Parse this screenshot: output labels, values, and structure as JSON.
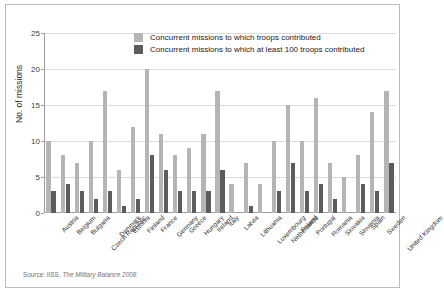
{
  "figure": {
    "background_color": "#ffffff",
    "border_color": "#b9bcc0",
    "source_prefix": "Source: IISS, ",
    "source_title": "The Military Balance",
    "source_year": " 2008."
  },
  "legend": {
    "position": "top-center",
    "items": [
      {
        "label": "Concurrent missions to which troops contributed",
        "color": "#b3b5b7",
        "swatch_name": "legend-swatch-light"
      },
      {
        "label": "Concurrent missions to which at least 100 troops contributed",
        "color": "#5a5c5e",
        "swatch_name": "legend-swatch-dark"
      }
    ]
  },
  "chart_data": {
    "type": "bar",
    "title": "",
    "xlabel": "",
    "ylabel": "No. of missions",
    "ylim": [
      0,
      25
    ],
    "yticks": [
      0,
      5,
      10,
      15,
      20,
      25
    ],
    "grid": true,
    "legend_position": "top-center",
    "categories": [
      "Austria",
      "Belgium",
      "Bulgaria",
      "Czech Republic",
      "Denmark",
      "Estonia",
      "Finland",
      "France",
      "Germany",
      "Greece",
      "Hungary",
      "Ireland",
      "Italy",
      "Latvia",
      "Lithuania",
      "Luxembourg",
      "Netherlands",
      "Poland",
      "Portugal",
      "Romania",
      "Slovakia",
      "Slovenia",
      "Spain",
      "Sweden",
      "United Kingdom"
    ],
    "series": [
      {
        "name": "Concurrent missions to which troops contributed",
        "color": "#b3b5b7",
        "values": [
          10,
          8,
          7,
          10,
          17,
          6,
          12,
          20,
          11,
          8,
          9,
          11,
          17,
          4,
          7,
          4,
          10,
          15,
          10,
          16,
          7,
          5,
          8,
          14,
          17
        ]
      },
      {
        "name": "Concurrent missions to which at least 100 troops contributed",
        "color": "#5a5c5e",
        "values": [
          3,
          4,
          3,
          2,
          3,
          1,
          2,
          8,
          6,
          3,
          3,
          3,
          6,
          0,
          1,
          0,
          3,
          7,
          3,
          4,
          2,
          0,
          4,
          3,
          7
        ]
      }
    ]
  }
}
